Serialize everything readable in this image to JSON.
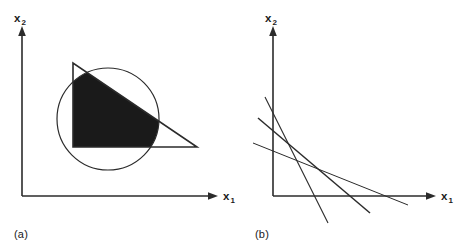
{
  "figure": {
    "background_color": "#ffffff",
    "ink_color": "#2b2b2b",
    "fill_color": "#1a1a1a"
  },
  "panel_a": {
    "caption": "(a)",
    "x_axis_label_base": "x",
    "x_axis_label_sub": "1",
    "y_axis_label_base": "x",
    "y_axis_label_sub": "2",
    "shapes": {
      "circle": {
        "cx": 108,
        "cy": 119,
        "r": 51
      },
      "triangle": {
        "points": "73,63 73,147 197,147"
      },
      "feasible_region_note": "intersection of triangle and circle, solid filled"
    },
    "axes": {
      "origin_x": 22,
      "origin_y": 196,
      "x_axis_end": 218,
      "y_axis_end": 30
    }
  },
  "panel_b": {
    "caption": "(b)",
    "x_axis_label_base": "x",
    "x_axis_label_sub": "1",
    "y_axis_label_base": "x",
    "y_axis_label_sub": "2",
    "axes": {
      "origin_x": 33,
      "origin_y": 196,
      "x_axis_end": 196,
      "y_axis_end": 30
    },
    "constraint_lines": [
      {
        "name": "line-1",
        "x1": 25,
        "y1": 97,
        "x2": 88,
        "y2": 223,
        "width": 1.1
      },
      {
        "name": "line-2",
        "x1": 18,
        "y1": 118,
        "x2": 130,
        "y2": 213,
        "width": 1.5
      },
      {
        "name": "line-3",
        "x1": 13,
        "y1": 143,
        "x2": 168,
        "y2": 205,
        "width": 1.0
      }
    ]
  },
  "chart_data": {
    "type": "line",
    "title": "",
    "subtitle": "",
    "xlabel": "x1",
    "ylabel": "x2",
    "grid": false,
    "legend": "none",
    "panels": [
      {
        "id": "a",
        "caption": "(a)",
        "description": "Feasible region formed by the intersection of a triangular region and a circular (disk) region; the intersection is shaded solid black.",
        "xlabel": "x1",
        "ylabel": "x2",
        "elements": [
          {
            "type": "circle",
            "name": "circular-constraint",
            "center": [
              108,
              119
            ],
            "radius": 51,
            "filled": false
          },
          {
            "type": "polygon",
            "name": "triangular-constraint",
            "vertices": [
              [
                73,
                63
              ],
              [
                73,
                147
              ],
              [
                197,
                147
              ]
            ],
            "filled": false
          },
          {
            "type": "region",
            "name": "feasible-region",
            "description": "triangle ∩ disk",
            "filled": true
          }
        ]
      },
      {
        "id": "b",
        "caption": "(b)",
        "description": "Three straight constraint lines with negative slopes crossing one another near the lower-left of the positive quadrant.",
        "xlabel": "x1",
        "ylabel": "x2",
        "series": [
          {
            "name": "line-1",
            "x": [
              25,
              88
            ],
            "y": [
              97,
              223
            ]
          },
          {
            "name": "line-2",
            "x": [
              18,
              130
            ],
            "y": [
              118,
              213
            ]
          },
          {
            "name": "line-3",
            "x": [
              13,
              168
            ],
            "y": [
              143,
              205
            ]
          }
        ]
      }
    ]
  }
}
